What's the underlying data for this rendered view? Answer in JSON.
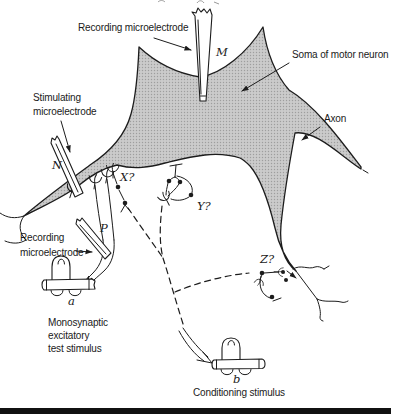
{
  "labels": {
    "recording_top": "Recording microelectrode",
    "electrode_m": "M",
    "soma": "Soma of motor neuron",
    "axon": "Axon",
    "stimulating_line1": "Stimulating",
    "stimulating_line2": "microelectrode",
    "electrode_n": "N",
    "synapse_x": "X?",
    "synapse_y": "Y?",
    "synapse_z": "Z?",
    "recording_lower_line1": "Recording",
    "recording_lower_line2": "microelectrode",
    "electrode_p": "P",
    "stimulator_a": "a",
    "stimulator_b": "b",
    "test_stim_line1": "Monosynaptic",
    "test_stim_line2": "excitatory",
    "test_stim_line3": "test stimulus",
    "conditioning": "Conditioning stimulus"
  },
  "colors": {
    "background": "#ffffff",
    "ink": "#1c1c1c",
    "soma_fill": "#cbcbcb",
    "soma_dots": "#9e9e9e",
    "bottom_bar": "#111111"
  }
}
